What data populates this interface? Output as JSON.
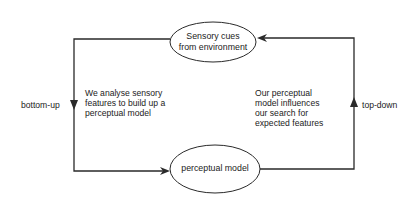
{
  "diagram": {
    "nodes": {
      "sensory_cues": {
        "lines": [
          "Sensory cues",
          "from environment"
        ]
      },
      "perceptual_model": {
        "lines": [
          "perceptual model"
        ]
      }
    },
    "edges": {
      "bottom_up": {
        "label": "bottom-up",
        "description": [
          "We analyse sensory",
          "features to build up a",
          "perceptual model"
        ]
      },
      "top_down": {
        "label": "top-down",
        "description": [
          "Our perceptual",
          "model influences",
          "our search for",
          "expected features"
        ]
      }
    },
    "colors": {
      "stroke": "#2a2a2a",
      "text": "#222222",
      "background": "#ffffff"
    }
  }
}
